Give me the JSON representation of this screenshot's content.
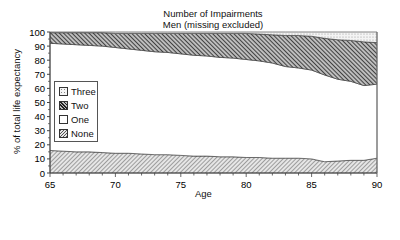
{
  "chart_data": {
    "type": "area",
    "stacked": true,
    "title": "Number of Impairments",
    "subtitle": "Men (missing excluded)",
    "xlabel": "Age",
    "ylabel": "% of total life expectancy",
    "xlim": [
      65,
      90
    ],
    "ylim": [
      0,
      100
    ],
    "x_ticks": [
      65,
      70,
      75,
      80,
      85,
      90
    ],
    "y_ticks": [
      0,
      10,
      20,
      30,
      40,
      50,
      60,
      70,
      80,
      90,
      100
    ],
    "grid": false,
    "legend_position": "left-center inside plot",
    "x": [
      65,
      66,
      67,
      68,
      69,
      70,
      71,
      72,
      73,
      74,
      75,
      76,
      77,
      78,
      79,
      80,
      81,
      82,
      83,
      84,
      85,
      86,
      87,
      88,
      89,
      90
    ],
    "series": [
      {
        "name": "None",
        "pattern": "light-diagonal-hatch",
        "values": [
          16,
          15.5,
          15,
          15,
          14.5,
          14,
          14,
          13.5,
          13,
          13,
          12.5,
          12,
          12,
          11.5,
          11.5,
          11,
          11,
          10.5,
          10.5,
          10.5,
          10,
          8,
          8.5,
          9,
          9,
          10.5
        ]
      },
      {
        "name": "One",
        "pattern": "white",
        "values": [
          76,
          76,
          76,
          75.5,
          75.5,
          75,
          74,
          73.5,
          73,
          72.5,
          72,
          71.5,
          71,
          70.5,
          70,
          69.5,
          68.5,
          67.5,
          65,
          64,
          63,
          61.5,
          58,
          56,
          53,
          52.5
        ]
      },
      {
        "name": "Two",
        "pattern": "dark-diagonal-hatch",
        "values": [
          7.5,
          8,
          8.5,
          9,
          9.5,
          10,
          11,
          12,
          13,
          13.5,
          14.5,
          15.5,
          16,
          17,
          17.5,
          18.5,
          19,
          20,
          22,
          23,
          24,
          26,
          28,
          29,
          31,
          29.5
        ]
      },
      {
        "name": "Three",
        "pattern": "dotted",
        "values": [
          0.5,
          0.5,
          0.5,
          0.5,
          0.5,
          1,
          1,
          1,
          1,
          1,
          1,
          1,
          1,
          1,
          1,
          1,
          1.5,
          2,
          2.5,
          2.5,
          3,
          4.5,
          5.5,
          6,
          7,
          7.5
        ]
      }
    ]
  },
  "legend": {
    "items": [
      {
        "label": "Three"
      },
      {
        "label": "Two"
      },
      {
        "label": "One"
      },
      {
        "label": "None"
      }
    ]
  },
  "axis": {
    "y_labels": [
      "0",
      "10",
      "20",
      "30",
      "40",
      "50",
      "60",
      "70",
      "80",
      "90",
      "100"
    ],
    "x_labels": [
      "65",
      "70",
      "75",
      "80",
      "85",
      "90"
    ]
  }
}
